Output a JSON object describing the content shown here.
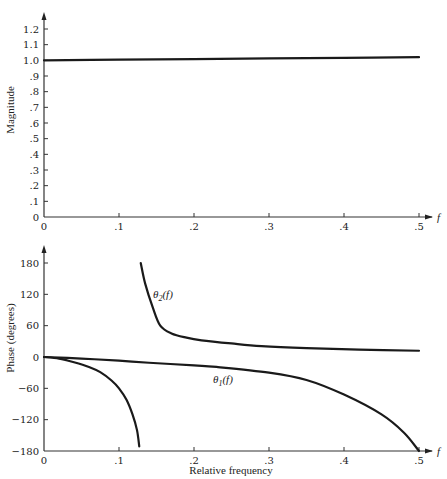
{
  "chart_data": [
    {
      "type": "line",
      "title": "",
      "xlabel": "f",
      "ylabel": "Magnitude",
      "xlim": [
        0,
        0.5
      ],
      "ylim": [
        0,
        1.2
      ],
      "grid": false,
      "x_ticks": [
        "0",
        ".1",
        ".2",
        ".3",
        ".4",
        ".5"
      ],
      "y_ticks": [
        "0",
        ".1",
        ".2",
        ".3",
        ".4",
        ".5",
        ".6",
        ".7",
        ".8",
        ".9",
        "1.0",
        "1.1",
        "1.2"
      ],
      "series": [
        {
          "name": "magnitude",
          "x": [
            0,
            0.1,
            0.2,
            0.3,
            0.4,
            0.5
          ],
          "values": [
            1.0,
            1.004,
            1.008,
            1.012,
            1.016,
            1.02
          ]
        }
      ]
    },
    {
      "type": "line",
      "title": "",
      "xlabel": "Relative frequency",
      "x_axis_symbol": "f",
      "ylabel": "Phase (degrees)",
      "xlim": [
        0,
        0.5
      ],
      "ylim": [
        -180,
        180
      ],
      "grid": false,
      "x_ticks": [
        "0",
        ".1",
        ".2",
        ".3",
        ".4",
        ".5"
      ],
      "y_ticks": [
        "-180",
        "-120",
        "-60",
        "0",
        "60",
        "120",
        "180"
      ],
      "series": [
        {
          "name": "θ1(f)",
          "x": [
            0,
            0.05,
            0.1,
            0.14,
            0.2,
            0.23,
            0.3,
            0.35,
            0.4,
            0.45,
            0.48,
            0.5
          ],
          "values": [
            0,
            -3,
            -7,
            -11,
            -16,
            -19,
            -30,
            -44,
            -72,
            -110,
            -145,
            -180
          ]
        },
        {
          "name": "θ2(f) (upper branch)",
          "x": [
            0.129,
            0.135,
            0.145,
            0.155,
            0.17,
            0.19,
            0.21,
            0.25,
            0.29,
            0.35,
            0.42,
            0.5
          ],
          "values": [
            180,
            140,
            95,
            60,
            45,
            37,
            32,
            26,
            21,
            17,
            14,
            12
          ]
        },
        {
          "name": "θ2(f) (lower branch)",
          "x": [
            0,
            0.02,
            0.04,
            0.06,
            0.075,
            0.09,
            0.1,
            0.11,
            0.118,
            0.124,
            0.127
          ],
          "values": [
            0,
            -3,
            -10,
            -19,
            -29,
            -45,
            -60,
            -82,
            -110,
            -140,
            -171
          ]
        }
      ],
      "annotations": [
        {
          "text": "θ2(f)",
          "x": 0.15,
          "y": 128
        },
        {
          "text": "θ1(f)",
          "x": 0.225,
          "y": -45
        }
      ]
    }
  ],
  "labels": {
    "magnitude_ylabel": "Magnitude",
    "phase_ylabel": "Phase (degrees)",
    "xlabel": "Relative frequency",
    "f_symbol": "f",
    "theta1_label": "θ",
    "theta1_sub": "1",
    "theta2_label": "θ",
    "theta2_sub": "2",
    "fn_arg": "(f)"
  }
}
